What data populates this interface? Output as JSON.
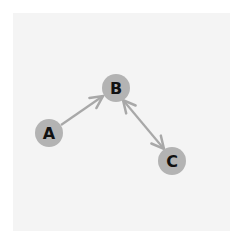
{
  "diagram": {
    "type": "directed-graph",
    "colors": {
      "background": "#ffffff",
      "panel": "#f4f4f4",
      "node_fill": "#b3b3b3",
      "edge": "#a8a8a8",
      "label": "#111111"
    },
    "nodes": [
      {
        "id": "A",
        "label": "A",
        "x": 49,
        "y": 133,
        "r": 14
      },
      {
        "id": "B",
        "label": "B",
        "x": 116,
        "y": 88,
        "r": 14
      },
      {
        "id": "C",
        "label": "C",
        "x": 172,
        "y": 161,
        "r": 14
      }
    ],
    "edges": [
      {
        "from": "A",
        "to": "B",
        "direction": "forward"
      },
      {
        "from": "B",
        "to": "C",
        "direction": "both"
      }
    ]
  }
}
